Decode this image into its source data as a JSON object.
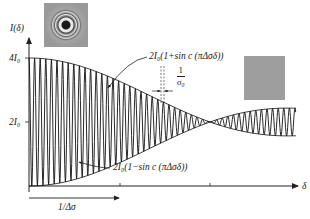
{
  "figure": {
    "y_axis_label": "I(δ)",
    "x_axis_label": "δ",
    "y_ticks": [
      {
        "label": "4I₀",
        "value": 4
      },
      {
        "label": "2I₀",
        "value": 2
      }
    ],
    "upper_envelope_label": "2I₀(1+sin c (πΔσδ))",
    "lower_envelope_label": "2I₀(1−sin c (πΔσδ))",
    "period_marker": {
      "numerator": "1",
      "denominator": "σ₀"
    },
    "x_span_marker": {
      "label": "1/Δσ"
    },
    "thumbnails": [
      {
        "name": "ring-fringe-pattern",
        "description": "concentric interference rings"
      },
      {
        "name": "uniform-gray-field",
        "description": "uniform gray, no fringes"
      }
    ]
  },
  "chart_data": {
    "type": "line",
    "title": "",
    "xlabel": "δ",
    "ylabel": "I(δ)",
    "y_tick_labels": [
      "2I₀",
      "4I₀"
    ],
    "y_tick_values": [
      2,
      4
    ],
    "ylim": [
      0,
      4
    ],
    "x_markers": [
      "1/Δσ"
    ],
    "series": [
      {
        "name": "I(δ) = 2I₀(1 + sinc(πΔσδ)·cos(2πσ₀δ))",
        "description": "rapid oscillation (period 1/σ₀) inside sinc envelope"
      },
      {
        "name": "upper envelope",
        "formula": "2I₀(1+sinc(πΔσδ))",
        "values_at": {
          "δ=0": 4,
          "δ=1/Δσ": 2
        }
      },
      {
        "name": "lower envelope",
        "formula": "2I₀(1−sinc(πΔσδ))",
        "values_at": {
          "δ=0": 0,
          "δ=1/Δσ": 2
        }
      }
    ],
    "grid": false,
    "legend": "inline annotations with arrows"
  }
}
